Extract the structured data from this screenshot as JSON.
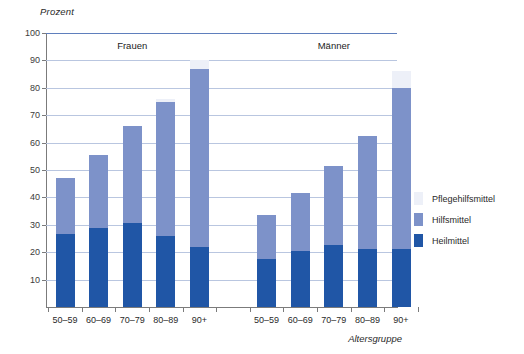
{
  "chart_data": {
    "type": "bar",
    "title": "",
    "subtype": "stacked-grouped-bar",
    "ylabel": "Prozent",
    "xlabel": "Altersgruppe",
    "ylim": [
      0,
      100
    ],
    "yticks": [
      10,
      20,
      30,
      40,
      50,
      60,
      70,
      80,
      90,
      100
    ],
    "grid": true,
    "legend_position": "right",
    "group_labels": [
      "Frauen",
      "Männer"
    ],
    "categories": [
      "50–59",
      "60–69",
      "70–79",
      "80–89",
      "90+"
    ],
    "series": [
      {
        "name": "Heilmittel",
        "color": "#2056a6",
        "frauen": [
          26.5,
          29.0,
          30.5,
          26.0,
          22.0
        ],
        "maenner": [
          17.5,
          20.5,
          22.5,
          21.0,
          21.0
        ]
      },
      {
        "name": "Hilfsmittel",
        "color": "#7d92c9",
        "frauen": [
          20.5,
          26.5,
          35.5,
          49.0,
          65.0
        ],
        "maenner": [
          16.0,
          21.0,
          29.0,
          41.5,
          59.0
        ]
      },
      {
        "name": "Pflegehilfsmittel",
        "color": "#edf0f8",
        "frauen": [
          0.0,
          0.0,
          0.0,
          1.0,
          3.0
        ],
        "maenner": [
          0.0,
          0.0,
          0.0,
          0.0,
          6.0
        ]
      }
    ],
    "totals": {
      "frauen": [
        47.0,
        55.5,
        66.0,
        76.0,
        90.0
      ],
      "maenner": [
        33.5,
        41.5,
        51.5,
        62.5,
        86.0
      ]
    }
  },
  "axis": {
    "y_title": "Prozent",
    "x_title": "Altersgruppe",
    "y_tick_labels": [
      "100",
      "90",
      "80",
      "70",
      "60",
      "50",
      "40",
      "30",
      "20",
      "10"
    ]
  },
  "groups": {
    "left_label": "Frauen",
    "right_label": "Männer"
  },
  "legend": {
    "items": [
      {
        "label": "Pflegehilfsmittel",
        "color": "#edf0f8"
      },
      {
        "label": "Hilfsmittel",
        "color": "#7d92c9"
      },
      {
        "label": "Heilmittel",
        "color": "#2056a6"
      }
    ]
  },
  "colors": {
    "heilmittel": "#2056a6",
    "hilfsmittel": "#7d92c9",
    "pflegehilfsmittel": "#edf0f8",
    "gridline": "#b9c6e0",
    "axis": "#7b7b7b"
  }
}
